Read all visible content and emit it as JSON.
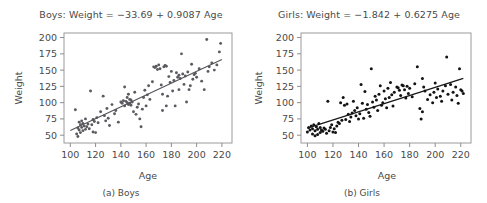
{
  "figure": {
    "background": "#ffffff",
    "point_color_boys": "#5a5a60",
    "point_color_girls": "#131315",
    "line_color_boys": "#55555a",
    "line_color_girls": "#18181a",
    "frame_color": "#9a9a9a"
  },
  "chart_data": [
    {
      "type": "scatter",
      "panel": "a",
      "title": "Boys: Weight = −33.69 + 0.9087 Age",
      "caption": "(a) Boys",
      "xlabel": "Age",
      "ylabel": "Weight",
      "xlim": [
        95,
        228
      ],
      "ylim": [
        38,
        207
      ],
      "xticks": [
        100,
        120,
        140,
        160,
        180,
        200,
        220
      ],
      "yticks": [
        50,
        75,
        100,
        125,
        150,
        175,
        200
      ],
      "grid": false,
      "legend": null,
      "fit_line": {
        "intercept": -33.69,
        "slope": 0.9087,
        "x_start": 100,
        "x_end": 220
      },
      "x": [
        104,
        105,
        106,
        106,
        107,
        107,
        108,
        108,
        109,
        109,
        110,
        110,
        111,
        112,
        112,
        113,
        114,
        115,
        116,
        117,
        118,
        118,
        119,
        120,
        121,
        122,
        124,
        126,
        127,
        128,
        129,
        130,
        131,
        133,
        135,
        136,
        138,
        140,
        141,
        142,
        143,
        143,
        144,
        145,
        145,
        146,
        146,
        147,
        147,
        148,
        148,
        149,
        150,
        151,
        152,
        153,
        154,
        155,
        156,
        157,
        158,
        159,
        160,
        161,
        162,
        163,
        165,
        166,
        167,
        168,
        169,
        170,
        171,
        172,
        173,
        173,
        174,
        175,
        176,
        176,
        177,
        178,
        179,
        180,
        181,
        182,
        183,
        184,
        185,
        186,
        186,
        187,
        188,
        189,
        190,
        191,
        192,
        193,
        194,
        195,
        196,
        197,
        198,
        199,
        200,
        202,
        204,
        206,
        208,
        209,
        210,
        212,
        214,
        216,
        218,
        219
      ],
      "y": [
        89,
        52,
        61,
        48,
        70,
        58,
        66,
        54,
        72,
        62,
        68,
        57,
        64,
        59,
        75,
        63,
        67,
        60,
        118,
        66,
        74,
        55,
        71,
        54,
        77,
        69,
        86,
        110,
        80,
        72,
        91,
        76,
        65,
        97,
        83,
        88,
        70,
        101,
        99,
        103,
        95,
        124,
        102,
        100,
        108,
        97,
        113,
        105,
        99,
        104,
        96,
        101,
        86,
        116,
        82,
        93,
        98,
        75,
        63,
        90,
        108,
        119,
        95,
        112,
        126,
        105,
        132,
        155,
        154,
        156,
        151,
        158,
        152,
        127,
        113,
        88,
        155,
        157,
        156,
        95,
        110,
        140,
        131,
        148,
        118,
        134,
        95,
        146,
        139,
        142,
        120,
        137,
        175,
        144,
        128,
        141,
        101,
        147,
        120,
        126,
        159,
        136,
        143,
        145,
        139,
        152,
        133,
        120,
        197,
        148,
        155,
        161,
        150,
        158,
        178,
        191
      ]
    },
    {
      "type": "scatter",
      "panel": "b",
      "title": "Girls: Weight = −1.842 + 0.6275 Age",
      "caption": "(b) Girls",
      "xlabel": "Age",
      "ylabel": "Weight",
      "xlim": [
        95,
        228
      ],
      "ylim": [
        38,
        207
      ],
      "xticks": [
        100,
        120,
        140,
        160,
        180,
        200,
        220
      ],
      "yticks": [
        50,
        75,
        100,
        125,
        150,
        175,
        200
      ],
      "grid": false,
      "legend": null,
      "fit_line": {
        "intercept": -1.842,
        "slope": 0.6275,
        "x_start": 100,
        "x_end": 222
      },
      "x": [
        100,
        101,
        102,
        103,
        104,
        104,
        105,
        106,
        106,
        107,
        108,
        108,
        109,
        110,
        110,
        111,
        112,
        113,
        114,
        115,
        116,
        117,
        118,
        119,
        120,
        121,
        122,
        123,
        124,
        125,
        126,
        127,
        128,
        129,
        130,
        131,
        132,
        133,
        134,
        135,
        136,
        137,
        138,
        139,
        140,
        141,
        142,
        143,
        144,
        145,
        146,
        147,
        148,
        149,
        150,
        151,
        152,
        153,
        154,
        155,
        156,
        157,
        158,
        159,
        160,
        161,
        162,
        163,
        164,
        165,
        166,
        167,
        168,
        170,
        171,
        172,
        173,
        174,
        175,
        176,
        177,
        178,
        179,
        180,
        182,
        184,
        186,
        188,
        189,
        190,
        190,
        191,
        192,
        194,
        196,
        198,
        199,
        200,
        201,
        202,
        204,
        205,
        206,
        208,
        209,
        210,
        212,
        213,
        214,
        216,
        217,
        218,
        219,
        220,
        221,
        222
      ],
      "y": [
        55,
        62,
        58,
        64,
        60,
        52,
        66,
        57,
        49,
        63,
        59,
        51,
        68,
        62,
        54,
        58,
        56,
        61,
        59,
        53,
        102,
        57,
        62,
        66,
        55,
        60,
        54,
        64,
        70,
        68,
        100,
        73,
        108,
        96,
        74,
        98,
        82,
        71,
        78,
        84,
        102,
        88,
        80,
        92,
        75,
        83,
        128,
        99,
        76,
        117,
        90,
        97,
        85,
        79,
        152,
        101,
        93,
        110,
        104,
        88,
        113,
        126,
        96,
        100,
        118,
        106,
        92,
        122,
        108,
        131,
        112,
        95,
        116,
        124,
        123,
        119,
        111,
        127,
        126,
        120,
        107,
        125,
        114,
        122,
        109,
        129,
        155,
        91,
        75,
        137,
        86,
        124,
        118,
        105,
        112,
        100,
        116,
        130,
        108,
        121,
        110,
        102,
        118,
        126,
        170,
        113,
        128,
        104,
        116,
        124,
        111,
        99,
        152,
        120,
        118,
        114
      ]
    }
  ]
}
